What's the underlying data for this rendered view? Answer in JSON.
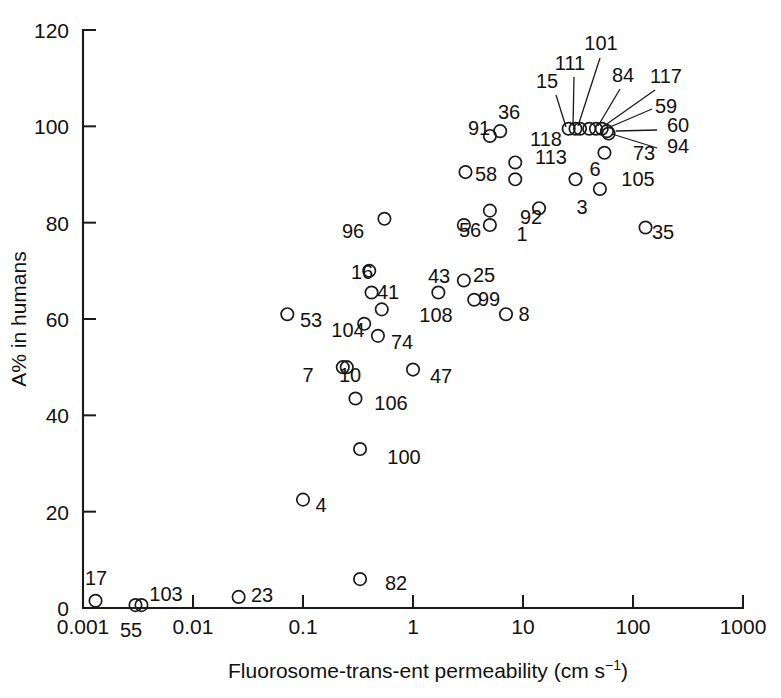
{
  "chart_data": {
    "type": "scatter",
    "title": "",
    "xlabel": "Fluorosome-trans-ent permeability (cm s⁻¹)",
    "ylabel": "A% in humans",
    "xscale": "log",
    "yscale": "linear",
    "xlim": [
      0.001,
      1000
    ],
    "ylim": [
      0,
      120
    ],
    "xticks": [
      0.001,
      0.01,
      0.1,
      1,
      10,
      100,
      1000
    ],
    "xticklabels": [
      "0.001",
      "0.01",
      "0.1",
      "1",
      "10",
      "100",
      "1000"
    ],
    "yticks": [
      0,
      20,
      40,
      60,
      80,
      100,
      120
    ],
    "yticklabels": [
      "0",
      "20",
      "40",
      "60",
      "80",
      "100",
      "120"
    ],
    "grid": false,
    "legend": null,
    "marker": "open-circle",
    "points": [
      {
        "label": "17",
        "x": 0.0013,
        "y": 1.5,
        "lx": 96,
        "ly": 585,
        "anchor": "middle"
      },
      {
        "label": "55",
        "x": 0.003,
        "y": 0.6,
        "lx": 131,
        "ly": 637,
        "anchor": "middle"
      },
      {
        "label": "103",
        "x": 0.0034,
        "y": 0.6,
        "lx": 166,
        "ly": 601,
        "anchor": "middle"
      },
      {
        "label": "23",
        "x": 0.026,
        "y": 2.3,
        "lx": 262,
        "ly": 602,
        "anchor": "middle"
      },
      {
        "label": "82",
        "x": 0.33,
        "y": 6.0,
        "lx": 396,
        "ly": 590,
        "anchor": "middle"
      },
      {
        "label": "4",
        "x": 0.1,
        "y": 22.5,
        "lx": 321,
        "ly": 512,
        "anchor": "middle"
      },
      {
        "label": "100",
        "x": 0.33,
        "y": 33.0,
        "lx": 404,
        "ly": 464,
        "anchor": "middle"
      },
      {
        "label": "106",
        "x": 0.3,
        "y": 43.5,
        "lx": 391,
        "ly": 410,
        "anchor": "middle"
      },
      {
        "label": "7",
        "x": 0.23,
        "y": 50.0,
        "lx": 308,
        "ly": 382,
        "anchor": "middle"
      },
      {
        "label": "10",
        "x": 0.25,
        "y": 50.0,
        "lx": 350,
        "ly": 382,
        "anchor": "middle"
      },
      {
        "label": "47",
        "x": 1.0,
        "y": 49.5,
        "lx": 441,
        "ly": 383,
        "anchor": "middle"
      },
      {
        "label": "74",
        "x": 0.48,
        "y": 56.5,
        "lx": 402,
        "ly": 349,
        "anchor": "middle"
      },
      {
        "label": "104",
        "x": 0.36,
        "y": 59.0,
        "lx": 348,
        "ly": 337,
        "anchor": "middle"
      },
      {
        "label": "53",
        "x": 0.072,
        "y": 61.0,
        "lx": 311,
        "ly": 327,
        "anchor": "middle"
      },
      {
        "label": "108",
        "x": 0.52,
        "y": 62.0,
        "lx": 436,
        "ly": 322,
        "anchor": "middle"
      },
      {
        "label": "8",
        "x": 7.0,
        "y": 61.0,
        "lx": 524,
        "ly": 321,
        "anchor": "middle"
      },
      {
        "label": "99",
        "x": 3.6,
        "y": 64.0,
        "lx": 489,
        "ly": 306,
        "anchor": "middle"
      },
      {
        "label": "41",
        "x": 0.42,
        "y": 65.5,
        "lx": 388,
        "ly": 299,
        "anchor": "middle"
      },
      {
        "label": "43",
        "x": 1.7,
        "y": 65.5,
        "lx": 439,
        "ly": 283,
        "anchor": "middle"
      },
      {
        "label": "25",
        "x": 2.9,
        "y": 68.0,
        "lx": 484,
        "ly": 282,
        "anchor": "middle"
      },
      {
        "label": "16",
        "x": 0.4,
        "y": 70.0,
        "lx": 362,
        "ly": 279,
        "anchor": "middle"
      },
      {
        "label": "35",
        "x": 130.0,
        "y": 79.0,
        "lx": 663,
        "ly": 239,
        "anchor": "middle"
      },
      {
        "label": "56",
        "x": 2.9,
        "y": 79.5,
        "lx": 470,
        "ly": 237,
        "anchor": "middle"
      },
      {
        "label": "1",
        "x": 5.0,
        "y": 79.5,
        "lx": 522,
        "ly": 241,
        "anchor": "middle"
      },
      {
        "label": "96",
        "x": 0.55,
        "y": 80.8,
        "lx": 353,
        "ly": 238,
        "anchor": "middle"
      },
      {
        "label": "92",
        "x": 5.0,
        "y": 82.5,
        "lx": 531,
        "ly": 224,
        "anchor": "middle"
      },
      {
        "label": "3",
        "x": 14.0,
        "y": 83.0,
        "lx": 582,
        "ly": 214,
        "anchor": "middle"
      },
      {
        "label": "105",
        "x": 50.0,
        "y": 87.0,
        "lx": 638,
        "ly": 186,
        "anchor": "middle"
      },
      {
        "label": "58",
        "x": 3.0,
        "y": 90.5,
        "lx": 486,
        "ly": 181,
        "anchor": "middle"
      },
      {
        "label": "6",
        "x": 30.0,
        "y": 89.0,
        "lx": 595,
        "ly": 176,
        "anchor": "middle"
      },
      {
        "label": "113",
        "x": 8.5,
        "y": 89.0,
        "lx": 551,
        "ly": 164,
        "anchor": "middle"
      },
      {
        "label": "73",
        "x": 55.0,
        "y": 94.5,
        "lx": 644,
        "ly": 160,
        "anchor": "middle"
      },
      {
        "label": "118",
        "x": 8.5,
        "y": 92.5,
        "lx": 546,
        "ly": 146,
        "anchor": "middle"
      },
      {
        "label": "91",
        "x": 5.0,
        "y": 98.0,
        "lx": 479,
        "ly": 135,
        "anchor": "middle"
      },
      {
        "label": "36",
        "x": 6.2,
        "y": 99.0,
        "lx": 509,
        "ly": 119,
        "anchor": "middle"
      },
      {
        "label": "15",
        "x": 26.0,
        "y": 99.5,
        "lx": 547,
        "ly": 88,
        "anchor": "middle",
        "leader": [
          556,
          95,
          566,
          127
        ]
      },
      {
        "label": "111",
        "x": 30.0,
        "y": 99.5,
        "lx": 570,
        "ly": 70,
        "anchor": "middle",
        "leader": [
          574,
          77,
          573,
          126
        ]
      },
      {
        "label": "101",
        "x": 33.0,
        "y": 99.5,
        "lx": 601,
        "ly": 50,
        "anchor": "middle",
        "leader": [
          600,
          58,
          578,
          126
        ]
      },
      {
        "label": "84",
        "x": 40.0,
        "y": 99.5,
        "lx": 623,
        "ly": 82,
        "anchor": "middle",
        "leader": [
          620,
          89,
          598,
          126
        ]
      },
      {
        "label": "117",
        "x": 46.0,
        "y": 99.5,
        "lx": 666,
        "ly": 83,
        "anchor": "middle",
        "leader": [
          655,
          90,
          604,
          126
        ]
      },
      {
        "label": "59",
        "x": 52.0,
        "y": 99.5,
        "lx": 666,
        "ly": 113,
        "anchor": "middle",
        "leader": [
          652,
          109,
          610,
          127
        ]
      },
      {
        "label": "60",
        "x": 58.0,
        "y": 99.0,
        "lx": 678,
        "ly": 132,
        "anchor": "middle",
        "leader": [
          657,
          130,
          616,
          131
        ]
      },
      {
        "label": "94",
        "x": 60.0,
        "y": 98.5,
        "lx": 678,
        "ly": 153,
        "anchor": "middle",
        "leader": [
          657,
          148,
          612,
          134
        ]
      }
    ]
  }
}
